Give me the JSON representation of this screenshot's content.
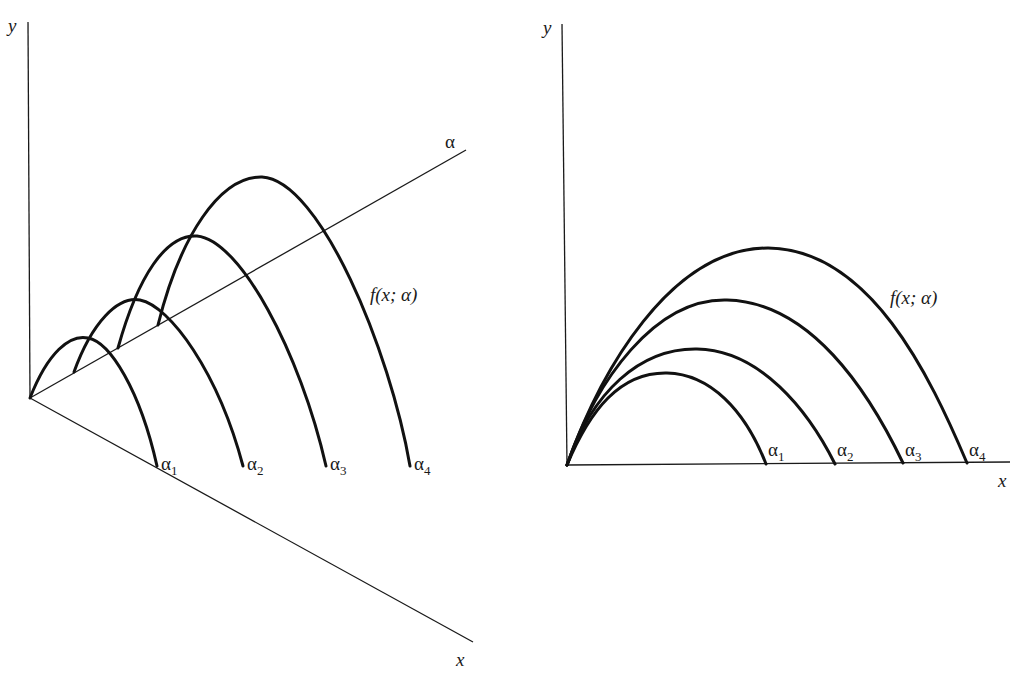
{
  "figure": {
    "left_panel": {
      "description": "3D perspective view: family of curves f(x; α) plotted over the (x, α) plane",
      "axes": {
        "y_label": "y",
        "x_label": "x",
        "alpha_label": "α"
      },
      "function_label": "f(x; α)",
      "curves": [
        {
          "name": "α",
          "sub": "1"
        },
        {
          "name": "α",
          "sub": "2"
        },
        {
          "name": "α",
          "sub": "3"
        },
        {
          "name": "α",
          "sub": "4"
        }
      ]
    },
    "right_panel": {
      "description": "2D projection: curves f(x; α) for α1..α4 sharing the origin",
      "axes": {
        "y_label": "y",
        "x_label": "x"
      },
      "function_label": "f(x; α)",
      "curves": [
        {
          "name": "α",
          "sub": "1"
        },
        {
          "name": "α",
          "sub": "2"
        },
        {
          "name": "α",
          "sub": "3"
        },
        {
          "name": "α",
          "sub": "4"
        }
      ]
    }
  },
  "colors": {
    "ink": "#111111",
    "background": "#ffffff"
  }
}
